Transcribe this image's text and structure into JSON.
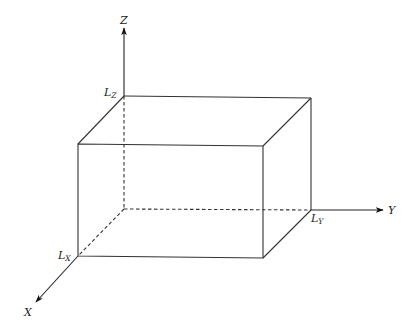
{
  "diagram": {
    "type": "3d-box-with-axes",
    "axes": {
      "x": {
        "label": "X"
      },
      "y": {
        "label": "Y"
      },
      "z": {
        "label": "Z"
      }
    },
    "dimensions": {
      "lx": {
        "base": "L",
        "sub": "X"
      },
      "ly": {
        "base": "L",
        "sub": "Y"
      },
      "lz": {
        "base": "L",
        "sub": "Z"
      }
    },
    "colors": {
      "line": "#333333",
      "background": "#ffffff"
    }
  }
}
